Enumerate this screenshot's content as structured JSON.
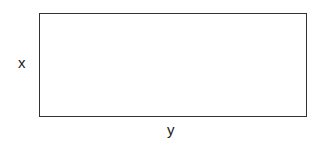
{
  "diagram": {
    "shape": "rectangle",
    "labels": {
      "left_side": "x",
      "bottom_side": "y"
    },
    "stroke_color": "#333333",
    "background": "#ffffff"
  }
}
